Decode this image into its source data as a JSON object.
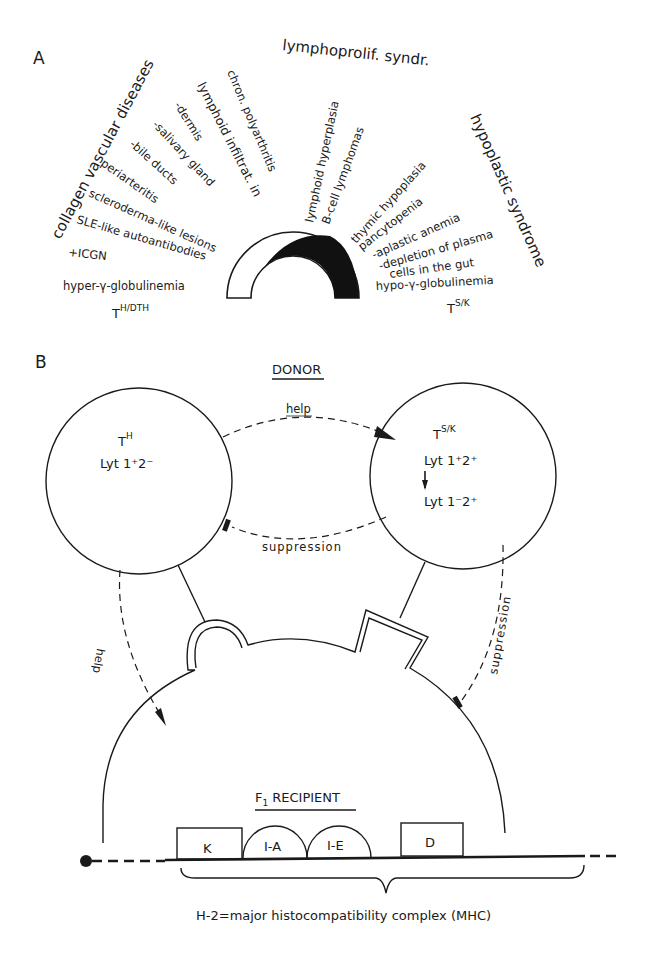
{
  "panel_a": {
    "label": "A",
    "groups": {
      "collagen": "collagen vascular diseases",
      "lymphoprolif": "lymphoprolif. syndr.",
      "hypoplastic": "hypoplastic syndrome"
    },
    "left_items": [
      "lymphoid infiltrat. in",
      "chron. polyarthritis",
      "-dermis",
      "-salivary gland",
      "-bile ducts",
      "periarteritis",
      "scleroderma-like lesions",
      "SLE-like autoantibodies",
      "+ICGN",
      "hyper-γ-globulinemia"
    ],
    "middle_items": [
      "lymphoid hyperplasia",
      "B-cell lymphomas"
    ],
    "right_items": [
      "thymic hypoplasia",
      "pancytopenia",
      "-aplastic anemia",
      "-depletion of plasma",
      "cells in the gut",
      "hypo-γ-globulinemia"
    ],
    "left_cell": {
      "base": "T",
      "sup": "H/DTH"
    },
    "right_cell": {
      "base": "T",
      "sup": "S/K"
    }
  },
  "panel_b": {
    "label": "B",
    "donor_title": "DONOR",
    "th_cell": {
      "base": "T",
      "sup": "H",
      "phenotype": "Lyt 1⁺2⁻"
    },
    "tsk_cell": {
      "base": "T",
      "sup": "S/K",
      "phenotype_1": "Lyt 1⁺2⁺",
      "phenotype_2": "Lyt 1⁻2⁺"
    },
    "arrows": {
      "help_top": "help",
      "suppression_mid": "suppression",
      "help_left": "help",
      "suppression_right": "suppression"
    },
    "recipient_title_base": "F",
    "recipient_title_sub": "1",
    "recipient_title_rest": "RECIPIENT",
    "mhc_regions": [
      "K",
      "I-A",
      "I-E",
      "D"
    ],
    "mhc_caption": "H-2=major histocompatibility complex (MHC)"
  }
}
